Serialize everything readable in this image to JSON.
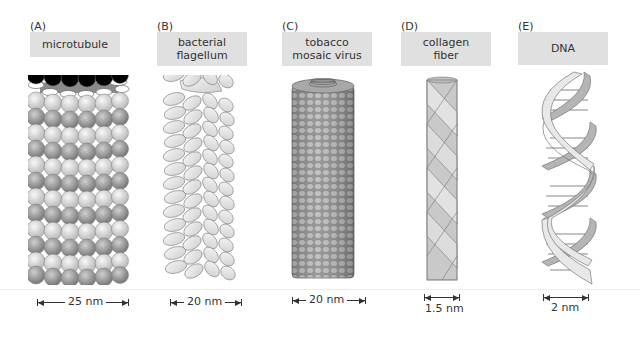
{
  "panels": [
    {
      "letter": "(A)",
      "label": "microtubule",
      "scale": "25 nm"
    },
    {
      "letter": "(B)",
      "label": "bacterial flagellum",
      "label_lines": [
        "bacterial",
        "flagellum"
      ],
      "scale": "20 nm"
    },
    {
      "letter": "(C)",
      "label": "tobacco mosaic virus",
      "label_lines": [
        "tobacco",
        "mosaic virus"
      ],
      "scale": "20 nm"
    },
    {
      "letter": "(D)",
      "label": "collagen fiber",
      "label_lines": [
        "collagen",
        "fiber"
      ],
      "scale": "1.5 nm"
    },
    {
      "letter": "(E)",
      "label": "DNA",
      "scale": "2 nm"
    }
  ],
  "colors": {
    "label_bg": "#e0e0e0",
    "subunit_dark": "#9a9a9a",
    "subunit_light": "#d8d8d8",
    "text": "#333333"
  }
}
